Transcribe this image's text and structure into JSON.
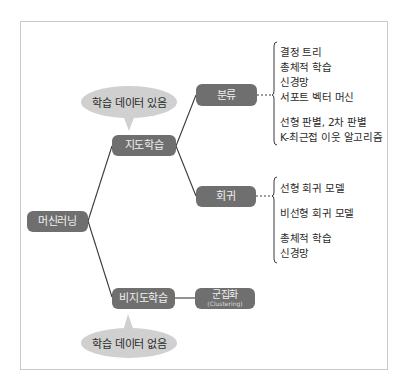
{
  "diagram": {
    "title": "",
    "colors": {
      "node_fill": "#6f6f6f",
      "node_text": "#f0f0f0",
      "bubble_fill": "#d0d0d0",
      "line": "#3a3a3a",
      "frame_border": "#c9c9c9"
    },
    "root": {
      "label": "머신러닝"
    },
    "supervised": {
      "label": "지도학습",
      "bubble": "학습 데이터 있음",
      "classification": {
        "label": "분류",
        "items": [
          "결정 트리",
          "총체적 학습",
          "신경망",
          "서포트 벡터 머신",
          "선형 판별, 2차 판별",
          "K-최근접 이웃 알고리즘"
        ]
      },
      "regression": {
        "label": "회귀",
        "items": [
          "선형 회귀 모델",
          "비선형 회귀 모델",
          "총체적 학습",
          "신경망"
        ]
      }
    },
    "unsupervised": {
      "label": "비지도학습",
      "bubble": "학습 데이터 없음",
      "clustering": {
        "label": "군집화",
        "sublabel": "(Clustering)"
      }
    }
  }
}
